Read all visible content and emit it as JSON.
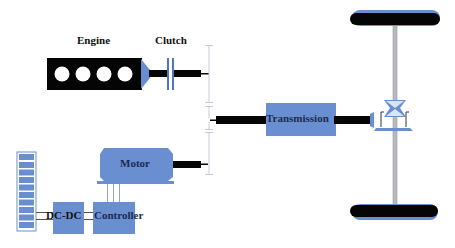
{
  "diagram": {
    "type": "parallel hybrid electric vehicle powertrain",
    "colors": {
      "component_blue": "#6a8fd0",
      "shaft_black": "#050505",
      "axle_gray": "#b8b8c0",
      "gear_line": "#c9c9d6",
      "battery_cell": "#6a8fd0",
      "text": "#111111"
    },
    "components": {
      "engine": {
        "label": "Engine",
        "cylinders": 4
      },
      "clutch": {
        "label": "Clutch"
      },
      "transmission": {
        "label": "Transmission"
      },
      "motor": {
        "label": "Motor"
      },
      "dcdc": {
        "label": "DC-DC"
      },
      "controller": {
        "label": "Controller"
      },
      "battery": {
        "cells": 10
      },
      "differential": {
        "label": ""
      },
      "wheels": [
        {
          "position": "top"
        },
        {
          "position": "bottom"
        }
      ]
    },
    "connections": [
      {
        "from": "Engine",
        "to": "Clutch",
        "type": "shaft"
      },
      {
        "from": "Clutch",
        "to": "Gear coupling",
        "type": "shaft"
      },
      {
        "from": "Motor",
        "to": "Gear coupling",
        "type": "shaft"
      },
      {
        "from": "Gear coupling",
        "to": "Transmission",
        "type": "shaft"
      },
      {
        "from": "Transmission",
        "to": "Differential",
        "type": "shaft"
      },
      {
        "from": "Differential",
        "to": "Wheels",
        "type": "axle"
      },
      {
        "from": "Battery",
        "to": "DC-DC",
        "type": "electrical"
      },
      {
        "from": "DC-DC",
        "to": "Controller",
        "type": "electrical"
      },
      {
        "from": "Controller",
        "to": "Motor",
        "type": "electrical"
      }
    ]
  }
}
